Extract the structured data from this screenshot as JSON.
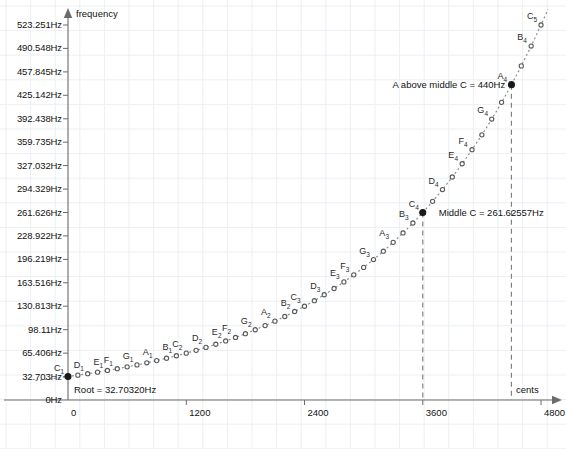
{
  "chart_data": {
    "type": "scatter",
    "title": "",
    "xlabel": "cents",
    "ylabel": "frequency",
    "xlim": [
      -340,
      5040
    ],
    "ylim": [
      -40,
      545
    ],
    "grid": true,
    "legend": null,
    "root_frequency_hz": 32.7032,
    "formula": "f = 32.7032 * 2^(cents/1200)",
    "x_ticks": [
      0,
      1200,
      2400,
      3600,
      4800
    ],
    "x_tick_labels": [
      "0",
      "1200",
      "2400",
      "3600",
      "4800"
    ],
    "y_ticks": [
      0,
      32.703,
      65.406,
      98.11,
      130.813,
      163.516,
      196.219,
      228.922,
      261.626,
      294.329,
      327.032,
      359.735,
      392.438,
      425.142,
      457.845,
      490.548,
      523.251
    ],
    "y_tick_labels": [
      "0Hz",
      "32.703Hz",
      "65.406Hz",
      "98.11Hz",
      "130.813Hz",
      "163.516Hz",
      "196.219Hz",
      "228.922Hz",
      "261.626Hz",
      "294.329Hz",
      "327.032Hz",
      "359.735Hz",
      "392.438Hz",
      "425.142Hz",
      "457.845Hz",
      "490.548Hz",
      "523.251Hz"
    ],
    "points": [
      {
        "cents": 0,
        "freq": 32.703,
        "label": "C",
        "octave": "1",
        "named": true
      },
      {
        "cents": 100,
        "freq": 34.648,
        "label": "",
        "octave": "",
        "named": false
      },
      {
        "cents": 200,
        "freq": 36.708,
        "label": "D",
        "octave": "1",
        "named": true
      },
      {
        "cents": 300,
        "freq": 38.891,
        "label": "",
        "octave": "",
        "named": false
      },
      {
        "cents": 400,
        "freq": 41.203,
        "label": "E",
        "octave": "1",
        "named": true
      },
      {
        "cents": 500,
        "freq": 43.654,
        "label": "F",
        "octave": "1",
        "named": true
      },
      {
        "cents": 600,
        "freq": 46.249,
        "label": "",
        "octave": "",
        "named": false
      },
      {
        "cents": 700,
        "freq": 48.999,
        "label": "G",
        "octave": "1",
        "named": true
      },
      {
        "cents": 800,
        "freq": 51.913,
        "label": "",
        "octave": "",
        "named": false
      },
      {
        "cents": 900,
        "freq": 55.0,
        "label": "A",
        "octave": "1",
        "named": true
      },
      {
        "cents": 1000,
        "freq": 58.27,
        "label": "",
        "octave": "",
        "named": false
      },
      {
        "cents": 1100,
        "freq": 61.735,
        "label": "B",
        "octave": "1",
        "named": true
      },
      {
        "cents": 1200,
        "freq": 65.406,
        "label": "C",
        "octave": "2",
        "named": true
      },
      {
        "cents": 1300,
        "freq": 69.296,
        "label": "",
        "octave": "",
        "named": false
      },
      {
        "cents": 1400,
        "freq": 73.416,
        "label": "D",
        "octave": "2",
        "named": true
      },
      {
        "cents": 1500,
        "freq": 77.782,
        "label": "",
        "octave": "",
        "named": false
      },
      {
        "cents": 1600,
        "freq": 82.407,
        "label": "E",
        "octave": "2",
        "named": true
      },
      {
        "cents": 1700,
        "freq": 87.307,
        "label": "F",
        "octave": "2",
        "named": true
      },
      {
        "cents": 1800,
        "freq": 92.499,
        "label": "",
        "octave": "",
        "named": false
      },
      {
        "cents": 1900,
        "freq": 97.999,
        "label": "G",
        "octave": "2",
        "named": true
      },
      {
        "cents": 2000,
        "freq": 103.826,
        "label": "",
        "octave": "",
        "named": false
      },
      {
        "cents": 2100,
        "freq": 110.0,
        "label": "A",
        "octave": "2",
        "named": true
      },
      {
        "cents": 2200,
        "freq": 116.541,
        "label": "",
        "octave": "",
        "named": false
      },
      {
        "cents": 2300,
        "freq": 123.471,
        "label": "B",
        "octave": "2",
        "named": true
      },
      {
        "cents": 2400,
        "freq": 130.813,
        "label": "C",
        "octave": "3",
        "named": true
      },
      {
        "cents": 2500,
        "freq": 138.591,
        "label": "",
        "octave": "",
        "named": false
      },
      {
        "cents": 2600,
        "freq": 146.832,
        "label": "D",
        "octave": "3",
        "named": true
      },
      {
        "cents": 2700,
        "freq": 155.563,
        "label": "",
        "octave": "",
        "named": false
      },
      {
        "cents": 2800,
        "freq": 164.814,
        "label": "E",
        "octave": "3",
        "named": true
      },
      {
        "cents": 2900,
        "freq": 174.614,
        "label": "F",
        "octave": "3",
        "named": true
      },
      {
        "cents": 3000,
        "freq": 184.997,
        "label": "",
        "octave": "",
        "named": false
      },
      {
        "cents": 3100,
        "freq": 195.998,
        "label": "G",
        "octave": "3",
        "named": true
      },
      {
        "cents": 3200,
        "freq": 207.652,
        "label": "",
        "octave": "",
        "named": false
      },
      {
        "cents": 3300,
        "freq": 220.0,
        "label": "A",
        "octave": "3",
        "named": true
      },
      {
        "cents": 3400,
        "freq": 233.082,
        "label": "",
        "octave": "",
        "named": false
      },
      {
        "cents": 3500,
        "freq": 246.942,
        "label": "B",
        "octave": "3",
        "named": true
      },
      {
        "cents": 3600,
        "freq": 261.626,
        "label": "C",
        "octave": "4",
        "named": true
      },
      {
        "cents": 3700,
        "freq": 277.183,
        "label": "",
        "octave": "",
        "named": false
      },
      {
        "cents": 3800,
        "freq": 293.665,
        "label": "D",
        "octave": "4",
        "named": true
      },
      {
        "cents": 3900,
        "freq": 311.127,
        "label": "",
        "octave": "",
        "named": false
      },
      {
        "cents": 4000,
        "freq": 329.628,
        "label": "E",
        "octave": "4",
        "named": true
      },
      {
        "cents": 4100,
        "freq": 349.228,
        "label": "F",
        "octave": "4",
        "named": true
      },
      {
        "cents": 4200,
        "freq": 369.994,
        "label": "",
        "octave": "",
        "named": false
      },
      {
        "cents": 4300,
        "freq": 391.995,
        "label": "G",
        "octave": "4",
        "named": true
      },
      {
        "cents": 4400,
        "freq": 415.305,
        "label": "",
        "octave": "",
        "named": false
      },
      {
        "cents": 4500,
        "freq": 440.0,
        "label": "A",
        "octave": "4",
        "named": true
      },
      {
        "cents": 4600,
        "freq": 466.164,
        "label": "",
        "octave": "",
        "named": false
      },
      {
        "cents": 4700,
        "freq": 493.883,
        "label": "B",
        "octave": "4",
        "named": true
      },
      {
        "cents": 4800,
        "freq": 523.251,
        "label": "C",
        "octave": "5",
        "named": true
      }
    ],
    "highlighted_points": [
      {
        "cents": 0,
        "freq": 32.703,
        "name": "root"
      },
      {
        "cents": 3600,
        "freq": 261.626,
        "name": "middle-c"
      },
      {
        "cents": 4500,
        "freq": 440.0,
        "name": "a440"
      }
    ],
    "guide_lines": [
      {
        "cents": 3600,
        "name": "middle-c-guide"
      },
      {
        "cents": 4500,
        "name": "a440-guide"
      }
    ],
    "annotations": [
      {
        "name": "root-annotation",
        "text": "Root = 32.70320Hz",
        "cents": 0,
        "freq": 32.703
      },
      {
        "name": "middle-c-annotation",
        "text": "Middle C = 261.62557Hz",
        "cents": 3600,
        "freq": 261.626
      },
      {
        "name": "a440-annotation",
        "text": "A above middle C = 440Hz",
        "cents": 4500,
        "freq": 440.0
      }
    ]
  },
  "axes": {
    "y_axis_name": "frequency",
    "x_axis_name": "cents"
  },
  "colors": {
    "axis": "#6b6b6b",
    "grid": "#eceff3",
    "curve": "#8a8a8a",
    "point": "#595959",
    "point_highlight": "#1a1a1a",
    "guide": "#7a7a7a",
    "text": "#121212",
    "background": "#ffffff"
  }
}
